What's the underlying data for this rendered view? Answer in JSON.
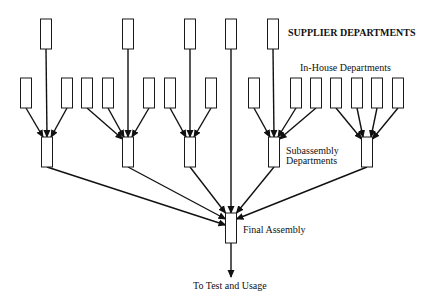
{
  "diagram": {
    "type": "flow-tree",
    "labels": {
      "supplier": "SUPPLIER DEPARTMENTS",
      "in_house": "In-House Departments",
      "subassembly_line1": "Subassembly",
      "subassembly_line2": "Departments",
      "final": "Final Assembly",
      "output": "To Test and Usage"
    },
    "supplier_departments": [
      {
        "id": "s1",
        "feeds": "sub1"
      },
      {
        "id": "s2",
        "feeds": "sub2"
      },
      {
        "id": "s3",
        "feeds": "sub3"
      },
      {
        "id": "s4",
        "feeds": "final"
      },
      {
        "id": "s5",
        "feeds": "sub4"
      }
    ],
    "in_house_departments": [
      {
        "id": "h1",
        "feeds": "sub1"
      },
      {
        "id": "h2",
        "feeds": "sub1"
      },
      {
        "id": "h3",
        "feeds": "sub2"
      },
      {
        "id": "h4",
        "feeds": "sub2"
      },
      {
        "id": "h5",
        "feeds": "sub2"
      },
      {
        "id": "h6",
        "feeds": "sub3"
      },
      {
        "id": "h7",
        "feeds": "sub3"
      },
      {
        "id": "h8",
        "feeds": "sub4"
      },
      {
        "id": "h9",
        "feeds": "sub4"
      },
      {
        "id": "h10",
        "feeds": "sub4"
      },
      {
        "id": "h11",
        "feeds": "sub5"
      },
      {
        "id": "h12",
        "feeds": "sub5"
      },
      {
        "id": "h13",
        "feeds": "sub5"
      },
      {
        "id": "h14",
        "feeds": "sub5"
      }
    ],
    "subassembly_departments": [
      {
        "id": "sub1",
        "feeds": "final"
      },
      {
        "id": "sub2",
        "feeds": "final"
      },
      {
        "id": "sub3",
        "feeds": "final"
      },
      {
        "id": "sub4",
        "feeds": "final"
      },
      {
        "id": "sub5",
        "feeds": "final"
      }
    ],
    "final_assembly": {
      "id": "final",
      "feeds": "output"
    }
  }
}
